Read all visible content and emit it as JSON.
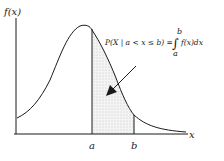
{
  "diagram": {
    "y_axis_label": "f(x)",
    "x_axis_label": "x",
    "tick_labels": [
      "a",
      "b"
    ],
    "formula": {
      "lhs": "P(X | a < x ≤ b) = ",
      "integral_upper": "b",
      "integral_lower": "a",
      "integrand": "f(x)dx"
    },
    "shaded_region": {
      "from": "a",
      "to": "b",
      "pattern": "dotted"
    },
    "colors": {
      "line": "#1a1a1a",
      "shade": "#d9d9d9"
    }
  }
}
